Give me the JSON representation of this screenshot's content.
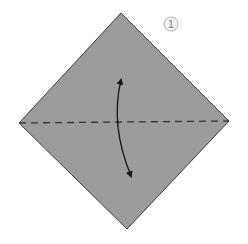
{
  "diagram": {
    "type": "origami-step",
    "step_badge": {
      "number": "1",
      "stroke": "#b0b0b0",
      "fill": "#f4f4f4",
      "text_color": "#7a7a7a"
    },
    "paper": {
      "shape": "square-as-diamond",
      "fill": "#9c9c9c",
      "stroke": "#3a3a3a",
      "vertices": {
        "top": [
          121,
          13
        ],
        "right": [
          229,
          121
        ],
        "bottom": [
          127,
          229
        ],
        "left": [
          19,
          123
        ]
      }
    },
    "fold_line": {
      "style": "valley-fold-dashed",
      "from": [
        19,
        123
      ],
      "to": [
        229,
        121
      ],
      "color": "#333333"
    },
    "arrow": {
      "type": "double-headed-curved",
      "direction": "fold-and-unfold",
      "color": "#1a1a1a"
    }
  }
}
